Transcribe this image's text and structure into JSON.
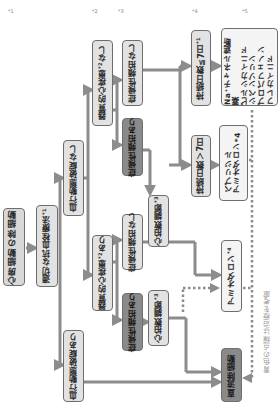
{
  "diagram": {
    "title": "心房細動の除細動",
    "orientation": "rotated-90-ccw",
    "colors": {
      "box_fill": "#e2e2e2",
      "box_dark_fill": "#8a8a8a",
      "box_border": "#6e6e6e",
      "arrow": "#8c8c8c",
      "dotted": "#8c8c8c",
      "note_text": "#9a9a9a"
    },
    "nodes": {
      "title": {
        "label": "心房細動の除細動"
      },
      "anticoag": {
        "label": "適切な抗血栓療法",
        "sup": "*1"
      },
      "hemo_stable": {
        "label": "血行動態破綻なし"
      },
      "hemo_unstable": {
        "label": "血行動態破綻あり"
      },
      "shd_none": {
        "label": "器質的心疾患",
        "sup": "*2",
        "suffix": "なし"
      },
      "shd_present": {
        "label": "器質的心疾患",
        "sup": "*2",
        "suffix": "あり"
      },
      "sym_none_upper": {
        "label": "症候性頻拍なし"
      },
      "sym_yes_upper": {
        "label": "症候性頻拍あり"
      },
      "sym_none_lower": {
        "label": "症候性頻拍なし"
      },
      "sym_yes_lower": {
        "label": "症候性頻拍あり"
      },
      "rate_upper": {
        "label": "心拍数調節",
        "sup": "*3"
      },
      "rate_lower": {
        "label": "心拍数調節",
        "sup": "*3"
      },
      "dur_le7": {
        "label": "持続日数≦7日",
        "sup": "*1"
      },
      "dur_gt7": {
        "label": "持続日数＞7日"
      },
      "na_blockers": {
        "lines": [
          "Na⁺チャネル遮断薬",
          "ピルシカイニド",
          "シベンゾリン",
          "プロパフェノン",
          "フレカイニド"
        ]
      },
      "bepridil_amio": {
        "lines": [
          "ベプリジル",
          "アミオダロン*4"
        ]
      },
      "amiodarone": {
        "label": "アミオダロン",
        "sup": "*4"
      },
      "dc_cardioversion": {
        "label": "直流除細動"
      }
    },
    "note": "青色の点線は治療を考慮",
    "footnote_marks": [
      "*1",
      "*2",
      "*3",
      "*4",
      "*5"
    ]
  }
}
